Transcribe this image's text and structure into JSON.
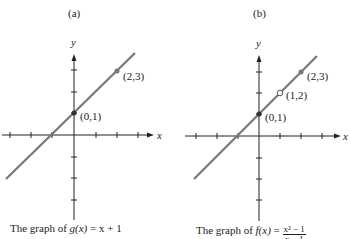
{
  "panels": [
    {
      "label": "(a)",
      "axis_x": "x",
      "axis_y": "y",
      "points": [
        {
          "label": "(0,1)",
          "type": "filled"
        },
        {
          "label": "(2,3)",
          "type": "filled"
        }
      ],
      "caption_prefix": "The graph of ",
      "caption_func": "g(x)",
      "caption_eq": " = x + 1"
    },
    {
      "label": "(b)",
      "axis_x": "x",
      "axis_y": "y",
      "points": [
        {
          "label": "(0,1)",
          "type": "filled"
        },
        {
          "label": "(1,2)",
          "type": "open"
        },
        {
          "label": "(2,3)",
          "type": "filled"
        }
      ],
      "caption_prefix": "The graph of ",
      "caption_func": "f(x)",
      "caption_eq": " = ",
      "caption_num": "x² − 1",
      "caption_den": "x − 1"
    }
  ],
  "colors": {
    "line": "#777777",
    "axis": "#222222"
  }
}
